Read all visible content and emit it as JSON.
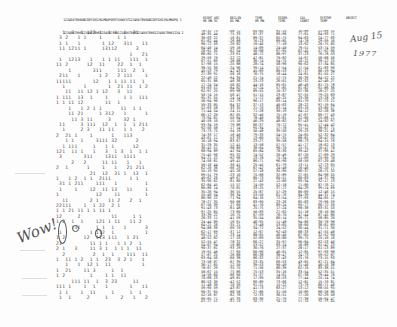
{
  "document": {
    "title": "Big Ear radio telescope computer printout",
    "header": {
      "channel_labels_row1": "1234567890ABCDEFGHIJKLMNOPQRSTUVWXYZ1234567890ABCDEFGHIJKLMNOPQ 1",
      "channel_labels_row2": "1234567890123456789012345678901234567890123456789012345678901234 2",
      "columns": [
        {
          "label": "RIGHT ASC",
          "sub": "HR MN SC"
        },
        {
          "label": "DECLIN",
          "sub": "DG MN"
        },
        {
          "label": "TIME",
          "sub": "HR MN"
        },
        {
          "label": "SIDER.",
          "sub": "TIME"
        },
        {
          "label": "CAL",
          "sub": "CONST"
        },
        {
          "label": "SYSTEM",
          "sub": "TEMP"
        },
        {
          "label": "OBJECT",
          "sub": ""
        }
      ]
    },
    "annotations": {
      "wow": "Wow!",
      "date_line1": "Aug 15",
      "date_line2": "1977",
      "circled_sequence": "6EQUJ5"
    },
    "rows_count": 80
  }
}
